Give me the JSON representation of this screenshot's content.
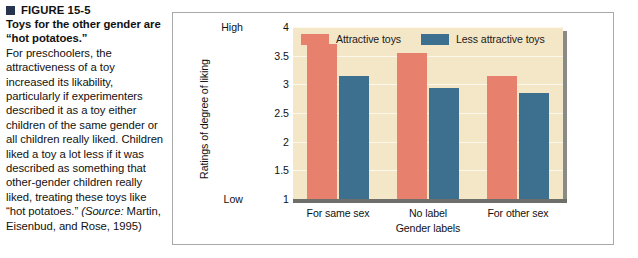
{
  "figure": {
    "bullet_icon": "square-bullet-icon",
    "number": "FIGURE 15-5",
    "title": "Toys for the other gender are “hot potatoes.”",
    "body_before_source": "For preschoolers, the attractiveness of a toy increased its likability, particularly if experimenters described it as a toy either children of the same gender or all children really liked. Children liked a toy a lot less if it was described as something that other-gender children really liked, treating these toys like “hot potatoes.” ",
    "source_prefix": "(Source:",
    "source_rest": " Martin, Eisenbud, and Rose, 1995)"
  },
  "chart_data": {
    "type": "bar",
    "title": "",
    "categories": [
      "For same sex",
      "No label",
      "For other sex"
    ],
    "series": [
      {
        "name": "Attractive toys",
        "color": "#e8806e",
        "values": [
          3.7,
          3.55,
          3.15
        ]
      },
      {
        "name": "Less attractive toys",
        "color": "#3d6f8e",
        "values": [
          3.15,
          2.93,
          2.85
        ]
      }
    ],
    "xlabel": "Gender labels",
    "ylabel": "Ratings of degree of liking",
    "ylim": [
      1,
      4
    ],
    "yticks": [
      "4",
      "3.5",
      "3",
      "2.5",
      "2",
      "1.5",
      "1"
    ],
    "ytick_values": [
      4,
      3.5,
      3,
      2.5,
      2,
      1.5,
      1
    ],
    "y_axis_high_label": "High",
    "y_axis_low_label": "Low",
    "grid": true,
    "legend_position": "top-left-inside",
    "plot_background_color": "#f4e7c8",
    "gridline_color": "#fdf8ec"
  }
}
